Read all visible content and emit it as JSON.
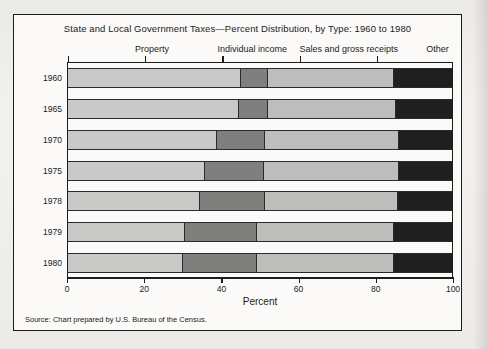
{
  "chart_panel": {
    "title": "State and Local Government Taxes—Percent Distribution, by Type: 1960 to 1980",
    "source": "Source: Chart prepared by U.S. Bureau of the Census."
  },
  "chart_data": {
    "type": "bar",
    "orientation": "horizontal",
    "stacked": true,
    "normalized_percent": true,
    "title": "State and Local Government Taxes—Percent Distribution, by Type: 1960 to 1980",
    "subtitle": "",
    "xlabel": "Percent",
    "ylabel": "",
    "xlim": [
      0,
      100
    ],
    "xticks": [
      0,
      20,
      40,
      60,
      80,
      100
    ],
    "xticklabels": [
      "0",
      "20",
      "40",
      "60",
      "80",
      "100"
    ],
    "grid": false,
    "legend_position": "top-inline-headers",
    "categories": [
      "1960",
      "1965",
      "1970",
      "1975",
      "1978",
      "1979",
      "1980"
    ],
    "series": [
      {
        "name": "Property",
        "color": "#c9c9c7",
        "header_center_percent": 22,
        "values": [
          44.8,
          44.3,
          38.6,
          35.5,
          34.2,
          30.3,
          29.8
        ]
      },
      {
        "name": "Individual income",
        "color": "#7f7f7d",
        "header_center_percent": 48,
        "values": [
          7.0,
          7.5,
          12.4,
          15.3,
          16.8,
          18.7,
          19.2
        ]
      },
      {
        "name": "Sales and gross receipts",
        "color": "#bdbdbb",
        "header_center_percent": 73,
        "values": [
          32.9,
          33.4,
          35.0,
          35.2,
          34.8,
          35.7,
          35.7
        ]
      },
      {
        "name": "Other",
        "color": "#1f1f1f",
        "header_center_percent": 96,
        "values": [
          15.3,
          14.8,
          14.0,
          14.0,
          14.2,
          15.3,
          15.3
        ]
      }
    ]
  }
}
